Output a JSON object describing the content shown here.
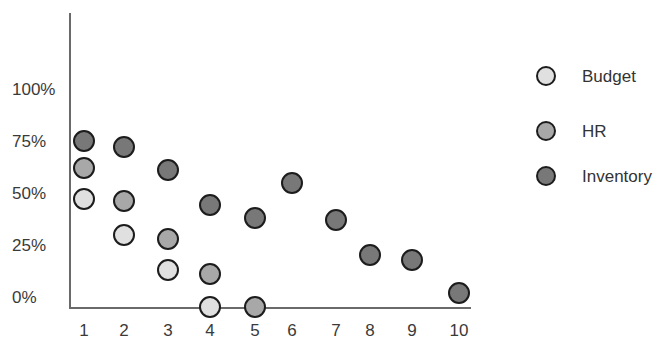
{
  "chart_data": {
    "type": "scatter",
    "title": "",
    "xlabel": "",
    "ylabel": "",
    "x": [
      1,
      2,
      3,
      4,
      5,
      6,
      7,
      8,
      9,
      10
    ],
    "x_tick_labels": [
      "1",
      "2",
      "3",
      "4",
      "5",
      "6",
      "7",
      "8",
      "9",
      "10"
    ],
    "y_tick_labels": [
      "0%",
      "25%",
      "50%",
      "75%",
      "100%"
    ],
    "ylim": [
      0,
      100
    ],
    "grid": false,
    "legend_position": "right",
    "series": [
      {
        "name": "Budget",
        "color": "#e0e0e0",
        "x": [
          1,
          2,
          3,
          4
        ],
        "values": [
          47,
          30,
          13,
          -5
        ]
      },
      {
        "name": "HR",
        "color": "#a8a8a8",
        "x": [
          1,
          2,
          3,
          4,
          5
        ],
        "values": [
          62,
          46,
          28,
          11,
          -5
        ]
      },
      {
        "name": "Inventory",
        "color": "#787878",
        "x": [
          1,
          2,
          3,
          4,
          5,
          6,
          7,
          8,
          9,
          10
        ],
        "values": [
          75,
          72,
          61,
          44,
          38,
          55,
          37,
          20,
          18,
          2
        ]
      }
    ]
  },
  "legend": {
    "items": [
      {
        "label": "Budget",
        "color": "#e0e0e0"
      },
      {
        "label": "HR",
        "color": "#a8a8a8"
      },
      {
        "label": "Inventory",
        "color": "#787878"
      }
    ]
  },
  "layout": {
    "x_pixel": {
      "1": 84,
      "2": 124,
      "3": 168,
      "4": 210,
      "5": 255,
      "6": 292,
      "7": 336,
      "8": 370,
      "9": 412,
      "10": 459
    },
    "y_zero_px": 297,
    "px_per_25pct": 52
  }
}
